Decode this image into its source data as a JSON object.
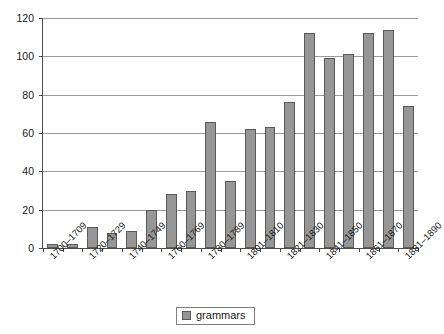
{
  "chart_data": {
    "type": "bar",
    "title": "",
    "subtitle": "",
    "xlabel": "",
    "ylabel": "",
    "ylim": [
      0,
      120
    ],
    "ytick_values": [
      0,
      20,
      40,
      60,
      80,
      100,
      120
    ],
    "ytick_labels": [
      "0",
      "20",
      "40",
      "60",
      "80",
      "100",
      "120"
    ],
    "grid": true,
    "legend_position": "bottom-center",
    "categories": [
      "1700–1709",
      "1710–1719",
      "1720–1729",
      "1730–1739",
      "1740–1749",
      "1750–1759",
      "1760–1769",
      "1770–1779",
      "1780–1789",
      "1790–1800",
      "1801–1810",
      "1811–1820",
      "1821–1830",
      "1831–1840",
      "1841–1850",
      "1851–1860",
      "1861–1870",
      "1871–1880",
      "1881–1890"
    ],
    "xtick_labels_shown": [
      "1700–1709",
      "1720–1729",
      "1740–1749",
      "1760–1769",
      "1780–1789",
      "1801–1810",
      "1821–1830",
      "1841–1850",
      "1861–1870",
      "1881–1890"
    ],
    "series": [
      {
        "name": "grammars",
        "color": "#969696",
        "values": [
          2,
          2,
          11,
          8,
          9,
          20,
          28,
          30,
          66,
          35,
          62,
          63,
          76,
          112,
          99,
          101,
          112,
          114,
          74
        ]
      }
    ],
    "legend": [
      "grammars"
    ]
  },
  "legend": {
    "label": "grammars",
    "swatch_color": "#969696"
  },
  "colors": {
    "bar_fill": "#969696",
    "bar_stroke": "#5a5a5a",
    "axis": "#4d4d4d",
    "gridline": "#9b9b9b",
    "text": "#1a1a1a",
    "background": "#ffffff"
  }
}
